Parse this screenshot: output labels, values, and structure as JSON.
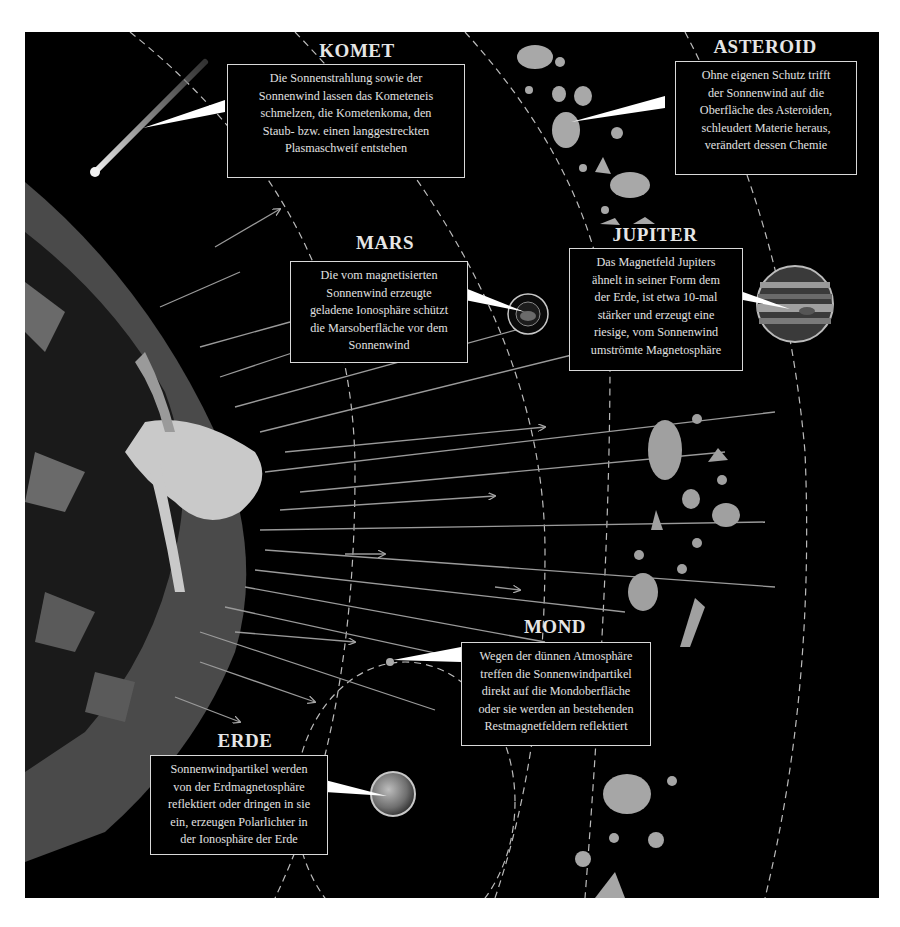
{
  "diagram": {
    "colors": {
      "background": "#000000",
      "text": "#e0e0e0",
      "sun_dark": "#5a5a5a",
      "sun_light": "#c8c8c8",
      "frame": "#ffffff"
    }
  },
  "labels": {
    "komet": {
      "title": "KOMET",
      "lines": [
        "Die Sonnenstrahlung sowie der",
        "Sonnenwind lassen das Kometeneis",
        "schmelzen, die Kometenkoma, den",
        "Staub- bzw. einen langgestreckten",
        "Plasmaschweif entstehen"
      ],
      "icon": "comet-icon"
    },
    "asteroid": {
      "title": "ASTEROID",
      "lines": [
        "Ohne eigenen Schutz trifft",
        "der Sonnenwind auf die",
        "Oberfläche des Asteroiden,",
        "schleudert Materie heraus,",
        "verändert dessen Chemie"
      ],
      "icon": "asteroid-icon"
    },
    "mars": {
      "title": "MARS",
      "lines": [
        "Die vom magnetisierten",
        "Sonnenwind erzeugte",
        "geladene Ionosphäre schützt",
        "die Marsoberfläche vor dem",
        "Sonnenwind"
      ],
      "icon": "mars-planet-icon"
    },
    "jupiter": {
      "title": "JUPITER",
      "lines": [
        "Das Magnetfeld Jupiters",
        "ähnelt in seiner Form dem",
        "der Erde, ist etwa 10-mal",
        "stärker und erzeugt eine",
        "riesige, vom Sonnenwind",
        "umströmte Magnetosphäre"
      ],
      "icon": "jupiter-planet-icon"
    },
    "mond": {
      "title": "MOND",
      "lines": [
        "Wegen der dünnen Atmosphäre",
        "treffen die Sonnenwindpartikel",
        "direkt auf die Mondoberfläche",
        "oder sie werden an bestehenden",
        "Restmagnetfeldern reflektiert"
      ],
      "icon": "moon-icon"
    },
    "erde": {
      "title": "ERDE",
      "lines": [
        "Sonnenwindpartikel werden",
        "von der Erdmagnetosphäre",
        "reflektiert oder dringen in sie",
        "ein, erzeugen Polarlichter in",
        "der Ionosphäre der Erde"
      ],
      "icon": "earth-planet-icon"
    }
  }
}
